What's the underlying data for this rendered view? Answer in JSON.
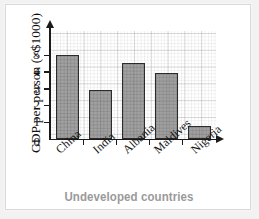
{
  "chart_data": {
    "type": "bar",
    "title": "",
    "categories": [
      "China",
      "India",
      "Albania",
      "Maldives",
      "Nigeria"
    ],
    "values": [
      5.0,
      2.9,
      4.5,
      3.9,
      0.8
    ],
    "xlabel": "Undeveloped countries",
    "ylabel": "GDP per person (×$1000)",
    "ylim": [
      0,
      5.6
    ],
    "yticks": [
      0,
      1,
      2,
      3,
      4,
      5
    ],
    "ytick_labels": [
      "0",
      "1",
      "2",
      "3",
      "4",
      "5"
    ],
    "grid": true,
    "legend": null,
    "colors": {
      "bar_fill": "#878787",
      "bar_border": "#2b2b2b",
      "axis": "#1a1a1a",
      "grid": "#969696",
      "xlabel_text": "#9a9a9a",
      "plot_background": "#ffffff",
      "card_border": "#d8d8d8",
      "page_background": "#f2f2f2"
    }
  },
  "axes": {
    "y_title": "GDP per person (×$1000)",
    "x_title": "Undeveloped countries",
    "y_tick_labels": [
      "5",
      "4",
      "3",
      "2",
      "1",
      "0"
    ],
    "category_labels": [
      "China",
      "India",
      "Albania",
      "Maldives",
      "Nigeria"
    ]
  }
}
